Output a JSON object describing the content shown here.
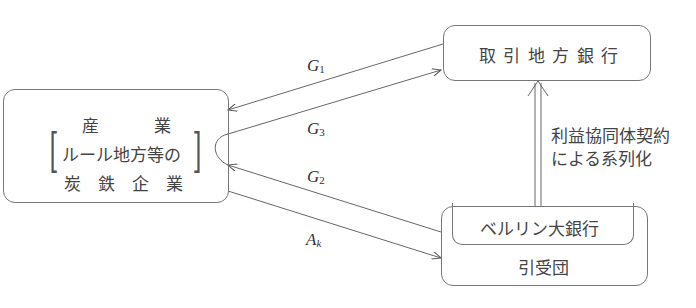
{
  "nodes": {
    "industry": {
      "title": "産　　　業",
      "line1": "ルール地方等の",
      "line2": "炭　鉄　企　業"
    },
    "regional_bank": {
      "label": "取 引 地 方 銀 行"
    },
    "syndicate": {
      "inner_label": "ベルリン大銀行",
      "label": "引受団"
    }
  },
  "edges": {
    "g1": {
      "base": "G",
      "sub": "1"
    },
    "g3": {
      "base": "G",
      "sub": "3"
    },
    "g2": {
      "base": "G",
      "sub": "2"
    },
    "ak": {
      "base": "A",
      "sub": "k"
    },
    "affiliation": {
      "line1": "利益協同体契約",
      "line2": "による系列化"
    }
  }
}
